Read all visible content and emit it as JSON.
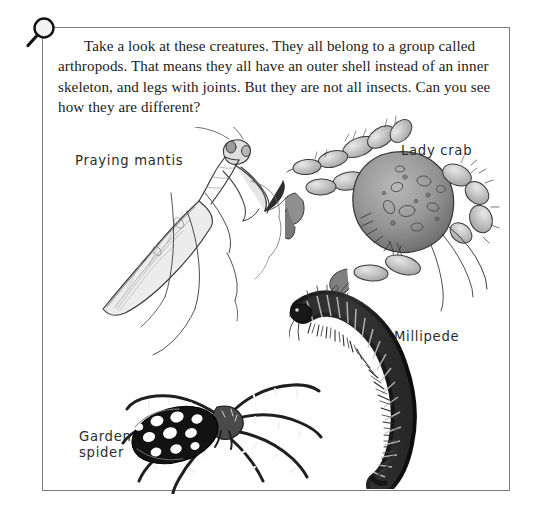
{
  "page": {
    "background_color": "#ffffff",
    "frame_border_color": "#7c7c7c"
  },
  "magnifier": {
    "icon": "magnifying-glass-icon",
    "color": "#111111"
  },
  "intro": {
    "paragraph": "Take a look at these creatures. They all belong to a group called arthropods. That means they all have an outer shell instead of an inner skeleton, and legs with joints. But they are not all insects. Can you see how they are different?"
  },
  "creatures": [
    {
      "id": "praying-mantis",
      "label": "Praying mantis",
      "illustration": "praying-mantis-illustration",
      "ink_color": "#3c3c3c"
    },
    {
      "id": "lady-crab",
      "label": "Lady crab",
      "illustration": "lady-crab-illustration",
      "ink_color": "#3c3c3c"
    },
    {
      "id": "millipede",
      "label": "Millipede",
      "illustration": "millipede-illustration",
      "ink_color": "#1a1a1a"
    },
    {
      "id": "garden-spider",
      "label": "Garden\nspider",
      "illustration": "garden-spider-illustration",
      "ink_color": "#111111"
    }
  ]
}
